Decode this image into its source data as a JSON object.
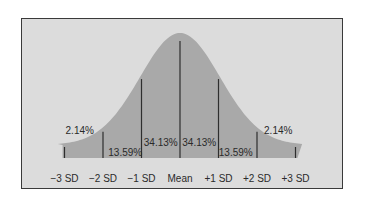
{
  "chart_data": {
    "type": "area",
    "title": "",
    "xlabel": "",
    "ylabel": "",
    "grid": false,
    "x_ticks": [
      "−3 SD",
      "−2 SD",
      "−1 SD",
      "Mean",
      "+1 SD",
      "+2 SD",
      "+3 SD"
    ],
    "x_tick_values": [
      -3,
      -2,
      -1,
      0,
      1,
      2,
      3
    ],
    "xlim": [
      -3.2,
      3.2
    ],
    "segments": [
      {
        "from": -3,
        "to": -2,
        "label": "2.14%",
        "value": 2.14
      },
      {
        "from": -2,
        "to": -1,
        "label": "13.59%",
        "value": 13.59
      },
      {
        "from": -1,
        "to": 0,
        "label": "34.13%",
        "value": 34.13
      },
      {
        "from": 0,
        "to": 1,
        "label": "34.13%",
        "value": 34.13
      },
      {
        "from": 1,
        "to": 2,
        "label": "13.59%",
        "value": 13.59
      },
      {
        "from": 2,
        "to": 3,
        "label": "2.14%",
        "value": 2.14
      }
    ],
    "curve": "normal distribution",
    "colors": {
      "background": "#dcdcdc",
      "curve_fill": "#a9a9a9",
      "lines": "#2e2e2e",
      "frame": "#3a3a3a"
    }
  }
}
